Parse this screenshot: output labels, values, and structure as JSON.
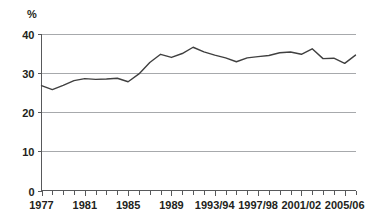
{
  "chart_data": {
    "type": "line",
    "title": "",
    "subtitle": "",
    "xlabel": "",
    "ylabel": "%",
    "ylim": [
      0,
      40
    ],
    "yticks": [
      0,
      10,
      20,
      30,
      40
    ],
    "ytick_labels": [
      "0",
      "10",
      "20",
      "30",
      "40"
    ],
    "grid": true,
    "grid_axis": "y",
    "legend": false,
    "legend_position": "none",
    "x": [
      "1977",
      "1978",
      "1979",
      "1980",
      "1981",
      "1982",
      "1983",
      "1984",
      "1985",
      "1986",
      "1987",
      "1988",
      "1989",
      "1990",
      "1991",
      "1992",
      "1993/94",
      "1994/95",
      "1995/96",
      "1996/97",
      "1997/98",
      "1998/99",
      "1999/00",
      "2000/01",
      "2001/02",
      "2002/03",
      "2003/04",
      "2004/05",
      "2005/06",
      "2006/07"
    ],
    "xtick_labels_shown": [
      "1977",
      "1981",
      "1985",
      "1989",
      "1993/94",
      "1997/98",
      "2001/02",
      "2005/06"
    ],
    "xtick_label_indices": [
      0,
      4,
      8,
      12,
      16,
      20,
      24,
      28
    ],
    "series": [
      {
        "name": "value",
        "color": "#404040",
        "values": [
          26.7,
          25.7,
          26.8,
          28.0,
          28.5,
          28.3,
          28.4,
          28.6,
          27.7,
          29.7,
          32.6,
          34.7,
          33.9,
          34.9,
          36.5,
          35.3,
          34.5,
          33.8,
          32.8,
          33.8,
          34.1,
          34.4,
          35.1,
          35.3,
          34.7,
          36.1,
          33.6,
          33.7,
          32.4,
          34.5
        ]
      }
    ],
    "colors": {
      "series_line": "#404040",
      "gridline": "#a7a9ac",
      "axis": "#58595b",
      "text": "#231f20",
      "background": "#ffffff"
    }
  },
  "axes": {
    "y_unit": "%"
  }
}
